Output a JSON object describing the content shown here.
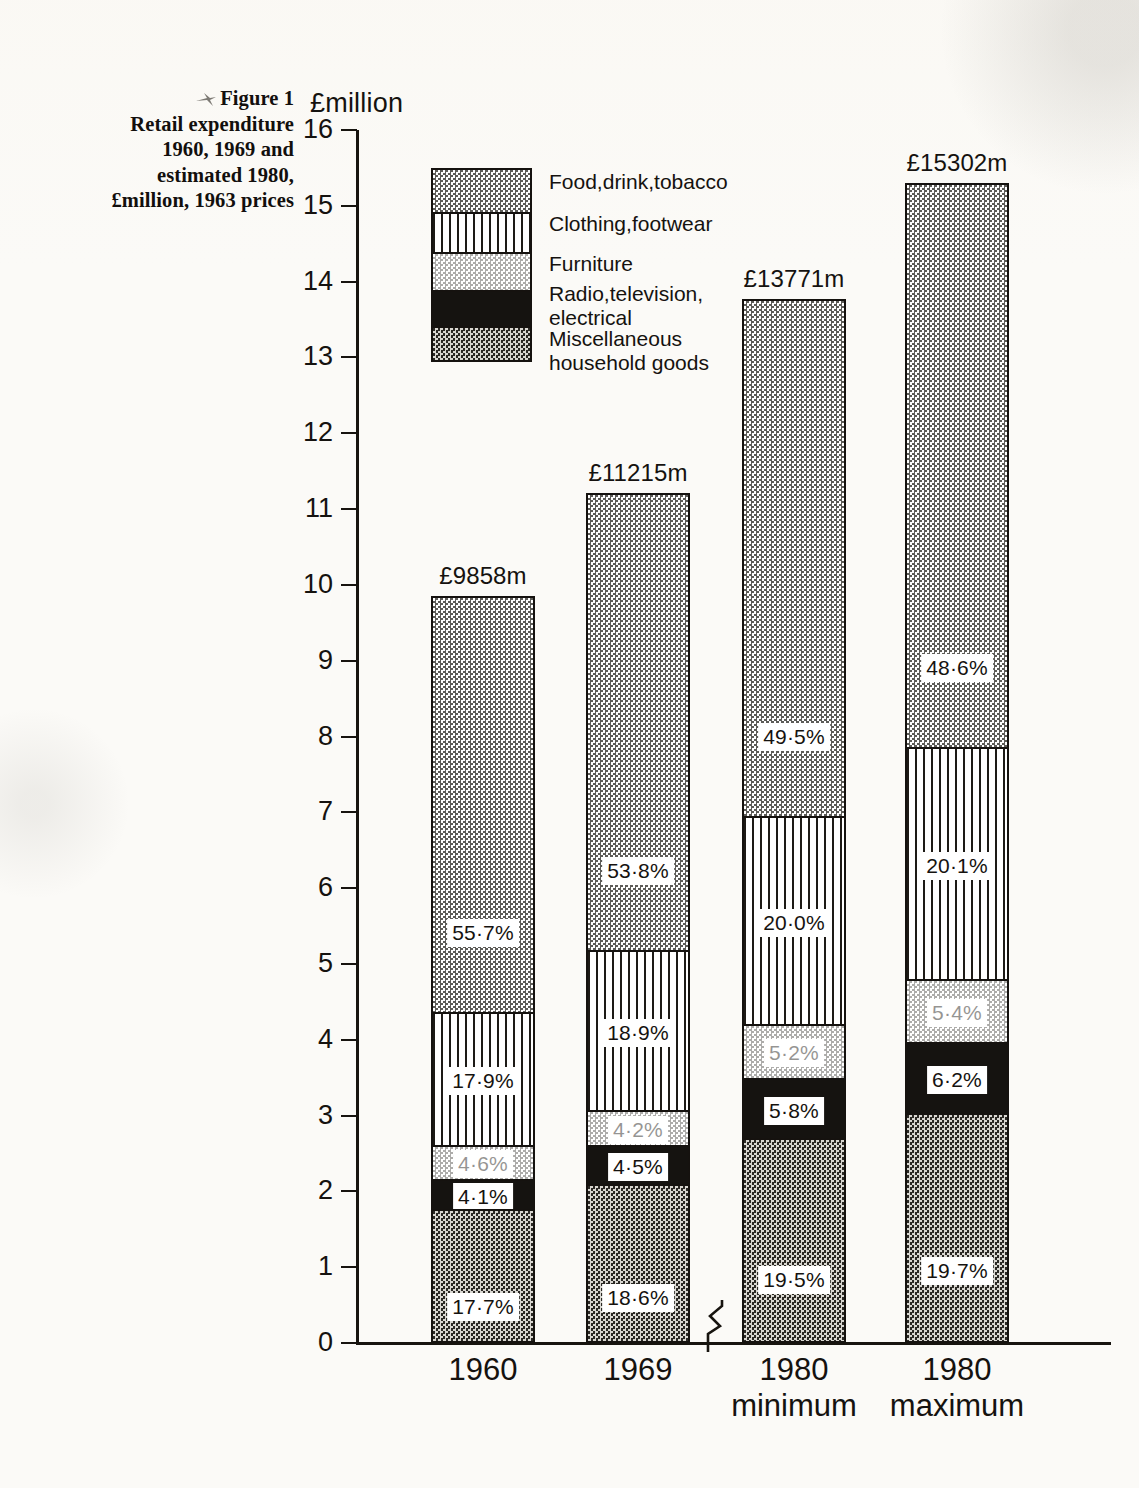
{
  "caption": {
    "marker_icon": "arrow-marker-icon",
    "lines": [
      "Figure 1",
      "Retail expenditure",
      "1960, 1969 and",
      "estimated 1980,",
      "£million, 1963 prices"
    ]
  },
  "axis": {
    "unit_label": "£million",
    "y_ticks": [
      "16",
      "15",
      "14",
      "13",
      "12",
      "11",
      "10",
      "9",
      "8",
      "7",
      "6",
      "5",
      "4",
      "3",
      "2",
      "1",
      "0"
    ],
    "break_marker": "axis-break-zigzag"
  },
  "legend": {
    "items": [
      {
        "key": "food",
        "label": "Food,drink,tobacco",
        "fill": "checker-grey"
      },
      {
        "key": "clothing",
        "label": "Clothing,footwear",
        "fill": "vertical-lines"
      },
      {
        "key": "furniture",
        "label": "Furniture",
        "fill": "fine-dots"
      },
      {
        "key": "radio",
        "label": "Radio,television,\nelectrical",
        "fill": "solid-black"
      },
      {
        "key": "misc",
        "label": "Miscellaneous\nhousehold goods",
        "fill": "dark-checker"
      }
    ]
  },
  "chart_data": {
    "type": "bar",
    "title": "Retail expenditure 1960, 1969 and estimated 1980, £million, 1963 prices",
    "subtitle": "Figure 1",
    "xlabel": "",
    "ylabel": "£million",
    "ylim": [
      0,
      16
    ],
    "grid": false,
    "stacked": true,
    "legend_position": "inside-top-left",
    "axis_break_between": [
      "1969",
      "1980 minimum"
    ],
    "categories": [
      "1960",
      "1969",
      "1980\nminimum",
      "1980\nmaximum"
    ],
    "category_labels": [
      {
        "year": "1960",
        "qualifier": ""
      },
      {
        "year": "1969",
        "qualifier": ""
      },
      {
        "year": "1980",
        "qualifier": "minimum"
      },
      {
        "year": "1980",
        "qualifier": "maximum"
      }
    ],
    "totals": [
      9858,
      11215,
      13771,
      15302
    ],
    "total_labels": [
      "£9858m",
      "£11215m",
      "£13771m",
      "£15302m"
    ],
    "series": [
      {
        "name": "Food,drink,tobacco",
        "key": "food",
        "percent": [
          55.7,
          53.8,
          49.5,
          48.6
        ],
        "percent_labels": [
          "55·7%",
          "53·8%",
          "49·5%",
          "48·6%"
        ],
        "values": [
          5491,
          6034,
          6817,
          7437
        ]
      },
      {
        "name": "Clothing,footwear",
        "key": "clothing",
        "percent": [
          17.9,
          18.9,
          20.0,
          20.1
        ],
        "percent_labels": [
          "17·9%",
          "18·9%",
          "20·0%",
          "20·1%"
        ],
        "values": [
          1765,
          2120,
          2754,
          3076
        ]
      },
      {
        "name": "Furniture",
        "key": "furniture",
        "percent": [
          4.6,
          4.2,
          5.2,
          5.4
        ],
        "percent_labels": [
          "4·6%",
          "4·2%",
          "5·2%",
          "5·4%"
        ],
        "values": [
          453,
          471,
          716,
          826
        ]
      },
      {
        "name": "Radio,television,electrical",
        "key": "radio",
        "percent": [
          4.1,
          4.5,
          5.8,
          6.2
        ],
        "percent_labels": [
          "4·1%",
          "4·5%",
          "5·8%",
          "6·2%"
        ],
        "values": [
          404,
          505,
          799,
          949
        ]
      },
      {
        "name": "Miscellaneous household goods",
        "key": "misc",
        "percent": [
          17.7,
          18.6,
          19.5,
          19.7
        ],
        "percent_labels": [
          "17·7%",
          "18·6%",
          "19·5%",
          "19·7%"
        ],
        "values": [
          1745,
          2086,
          2685,
          3014
        ]
      }
    ],
    "stack_order_bottom_to_top": [
      "misc",
      "radio",
      "furniture",
      "clothing",
      "food"
    ]
  },
  "colors": {
    "ink": "#15120f",
    "paper": "#fbfaf7",
    "food_fill": "#9a9892",
    "radio_fill": "#151310",
    "misc_fill": "#2a2824"
  }
}
